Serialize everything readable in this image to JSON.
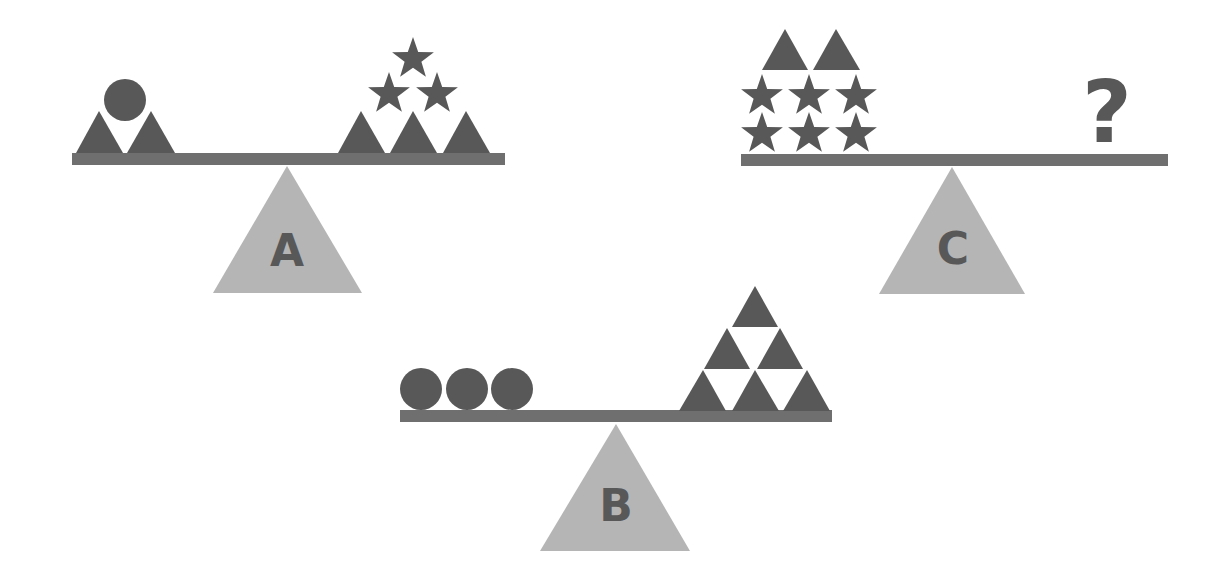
{
  "colors": {
    "background": "#ffffff",
    "weight_shape": "#585858",
    "beam": "#6f6f6f",
    "fulcrum": "#b5b5b5",
    "label": "#585858"
  },
  "scales": [
    {
      "id": "A",
      "label": "A",
      "left_pan": {
        "items": [
          "triangle",
          "triangle",
          "circle"
        ],
        "counts": {
          "triangle": 2,
          "circle": 1
        }
      },
      "right_pan": {
        "items": [
          "triangle",
          "triangle",
          "triangle",
          "star",
          "star",
          "star"
        ],
        "counts": {
          "triangle": 3,
          "star": 3
        }
      }
    },
    {
      "id": "B",
      "label": "B",
      "left_pan": {
        "items": [
          "circle",
          "circle",
          "circle"
        ],
        "counts": {
          "circle": 3
        }
      },
      "right_pan": {
        "items": [
          "triangle",
          "triangle",
          "triangle",
          "triangle",
          "triangle",
          "triangle"
        ],
        "counts": {
          "triangle": 6
        }
      }
    },
    {
      "id": "C",
      "label": "C",
      "left_pan": {
        "items": [
          "star",
          "star",
          "star",
          "star",
          "star",
          "star",
          "triangle",
          "triangle"
        ],
        "counts": {
          "star": 6,
          "triangle": 2
        }
      },
      "right_pan": {
        "items": [
          "unknown"
        ],
        "text": "?"
      }
    }
  ]
}
